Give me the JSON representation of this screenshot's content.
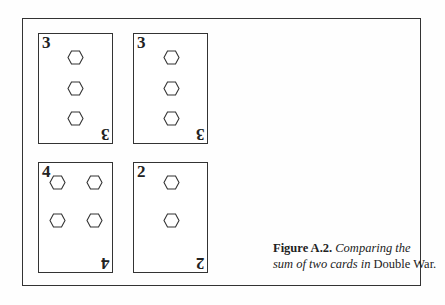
{
  "figure": {
    "label": "Figure A.2.",
    "caption_italic_1": "Comparing the",
    "caption_italic_2": "sum of two cards in",
    "caption_roman": "Double War."
  },
  "cards": [
    {
      "rank": "3",
      "pips": 3,
      "suit": "hexagon-icon",
      "position": "top-left"
    },
    {
      "rank": "3",
      "pips": 3,
      "suit": "hexagon-icon",
      "position": "top-right"
    },
    {
      "rank": "4",
      "pips": 4,
      "suit": "hexagon-icon",
      "position": "bottom-left"
    },
    {
      "rank": "2",
      "pips": 2,
      "suit": "hexagon-icon",
      "position": "bottom-right"
    }
  ]
}
